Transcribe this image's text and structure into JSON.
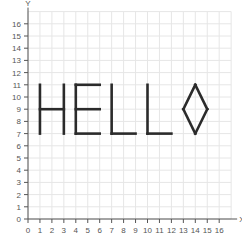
{
  "chart_data": {
    "type": "scatter",
    "title": "",
    "xlabel": "X",
    "ylabel": "Y",
    "xlim": [
      0,
      17
    ],
    "ylim": [
      0,
      17
    ],
    "grid": true,
    "x_ticks": [
      0,
      1,
      2,
      3,
      4,
      5,
      6,
      7,
      8,
      9,
      10,
      11,
      12,
      13,
      14,
      15,
      16
    ],
    "y_ticks": [
      0,
      1,
      2,
      3,
      4,
      5,
      6,
      7,
      8,
      9,
      10,
      11,
      12,
      13,
      14,
      15,
      16
    ],
    "shapes": [
      {
        "name": "H",
        "segments": [
          [
            [
              1,
              7
            ],
            [
              1,
              11
            ]
          ],
          [
            [
              3,
              7
            ],
            [
              3,
              11
            ]
          ],
          [
            [
              1,
              9
            ],
            [
              3,
              9
            ]
          ]
        ]
      },
      {
        "name": "E",
        "segments": [
          [
            [
              4,
              7
            ],
            [
              4,
              11
            ]
          ],
          [
            [
              4,
              11
            ],
            [
              6,
              11
            ]
          ],
          [
            [
              4,
              9
            ],
            [
              6,
              9
            ]
          ],
          [
            [
              4,
              7
            ],
            [
              6,
              7
            ]
          ]
        ]
      },
      {
        "name": "L",
        "segments": [
          [
            [
              7,
              11
            ],
            [
              7,
              7
            ]
          ],
          [
            [
              7,
              7
            ],
            [
              9,
              7
            ]
          ]
        ]
      },
      {
        "name": "L",
        "segments": [
          [
            [
              10,
              11
            ],
            [
              10,
              7
            ]
          ],
          [
            [
              10,
              7
            ],
            [
              12,
              7
            ]
          ]
        ]
      },
      {
        "name": "diamond",
        "segments": [
          [
            [
              14,
              11
            ],
            [
              15,
              9
            ]
          ],
          [
            [
              15,
              9
            ],
            [
              14,
              7
            ]
          ],
          [
            [
              14,
              7
            ],
            [
              13,
              9
            ]
          ],
          [
            [
              13,
              9
            ],
            [
              14,
              11
            ]
          ]
        ]
      }
    ],
    "text_depicted": "HELLO"
  },
  "axes": {
    "x_label": "X",
    "y_label": "Y"
  },
  "colors": {
    "grid": "#e6e6e6",
    "axis": "#555555",
    "shape_stroke": "#2b2b2b",
    "background": "#ffffff"
  }
}
